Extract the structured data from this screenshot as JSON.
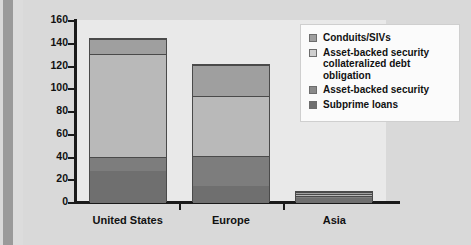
{
  "chart_data": {
    "type": "bar",
    "stacked": true,
    "title": "",
    "xlabel": "",
    "ylabel": "",
    "categories": [
      "United States",
      "Europe",
      "Asia"
    ],
    "ylim": [
      0,
      160
    ],
    "yticks": [
      0,
      20,
      40,
      60,
      80,
      100,
      120,
      140,
      160
    ],
    "grid": false,
    "legend_position": "top-right",
    "series": [
      {
        "name": "Subprime loans",
        "color": "#6f6f6f",
        "values": [
          28,
          15,
          4
        ]
      },
      {
        "name": "Asset-backed security",
        "color": "#7d7d7d",
        "values": [
          12,
          26,
          2
        ]
      },
      {
        "name": "Asset-backed security collateralized debt obligation",
        "color": "#b9b9b9",
        "values": [
          91,
          53,
          2
        ]
      },
      {
        "name": "Conduits/SIVs",
        "color": "#9f9f9f",
        "values": [
          13,
          27,
          2
        ]
      }
    ],
    "totals": [
      144,
      121,
      10
    ]
  },
  "legend": {
    "entries": [
      {
        "label": "Conduits/SIVs",
        "color": "#9f9f9f"
      },
      {
        "label": "Asset-backed security collateralized debt obligation",
        "color": "#cfcfcf"
      },
      {
        "label": "Asset-backed security",
        "color": "#8a8a8a"
      },
      {
        "label": "Subprime loans",
        "color": "#6f6f6f"
      }
    ]
  },
  "axis": {
    "y_labels": [
      "160",
      "140",
      "120",
      "100",
      "80",
      "60",
      "40",
      "20",
      "0"
    ]
  },
  "colors": {
    "page_background": "#d9d9d9",
    "plot_background": "#e9e9e9",
    "axis": "#1a1a1a",
    "legend_background": "#fbfbfb"
  }
}
